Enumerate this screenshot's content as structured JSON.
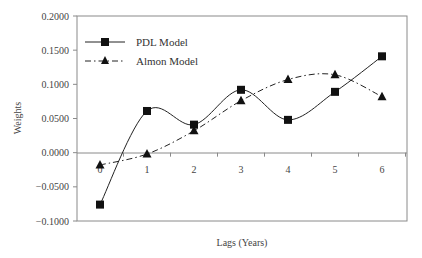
{
  "chart_data": {
    "type": "line",
    "title": "",
    "xlabel": "Lags (Years)",
    "ylabel": "Weights",
    "x": [
      0,
      1,
      2,
      3,
      4,
      5,
      6
    ],
    "x_tick_labels": [
      "0",
      "1",
      "2",
      "3",
      "4",
      "5",
      "6"
    ],
    "y_tick_labels": [
      "0.2000",
      "0.1500",
      "0.1000",
      "0.0500",
      "0.0000",
      "-0.0500",
      "-0.1000"
    ],
    "ylim": [
      -0.1,
      0.2
    ],
    "grid": false,
    "legend_position": "upper-left-inside",
    "series": [
      {
        "name": "PDL Model",
        "marker": "square",
        "line_style": "solid",
        "smooth": true,
        "values": [
          -0.076,
          0.061,
          0.041,
          0.092,
          0.048,
          0.089,
          0.141
        ]
      },
      {
        "name": "Almon Model",
        "marker": "triangle",
        "line_style": "dash-dot",
        "smooth": true,
        "values": [
          -0.018,
          -0.002,
          0.032,
          0.076,
          0.107,
          0.114,
          0.082
        ]
      }
    ]
  },
  "legend": {
    "pdl_label": "PDL Model",
    "almon_label": "Almon Model"
  },
  "axes": {
    "xlabel": "Lags (Years)",
    "ylabel": "Weights",
    "yticks": [
      "0.2000",
      "0.1500",
      "0.1000",
      "0.0500",
      "0.0000",
      "-0.0500",
      "-0.1000"
    ],
    "xticks": [
      "0",
      "1",
      "2",
      "3",
      "4",
      "5",
      "6"
    ]
  },
  "colors": {
    "line": "#222222",
    "frame": "#888888"
  }
}
